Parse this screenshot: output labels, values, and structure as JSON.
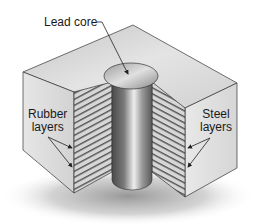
{
  "figure": {
    "type": "isometric cutaway diagram"
  },
  "labels": {
    "lead_core": "Lead core",
    "rubber": [
      "Rubber",
      "layers"
    ],
    "steel": [
      "Steel",
      "layers"
    ]
  },
  "colors": {
    "top_face": "#cfcfcf",
    "side_face": "#dedede",
    "layers_dark": "#5a5a5a",
    "layers_light": "#d4d4d4",
    "core_dark": "#555555",
    "core_light": "#e8e8e8",
    "outline": "#333333",
    "shadow": "#9a9a9a"
  }
}
